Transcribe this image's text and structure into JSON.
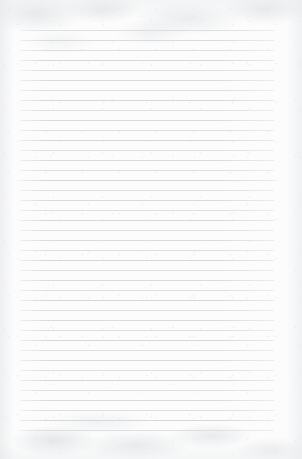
{
  "document": {
    "kind": "lined-notebook-paper",
    "title": "Blank Lined Paper",
    "content_text": "",
    "page_width": 302,
    "page_height": 459,
    "is_blank": "true"
  },
  "paper": {
    "background_color": "#fcfcfc",
    "texture_color": "#e3e5e9",
    "vignette_color": "#e2e4e8"
  },
  "ruling": {
    "line_color": "#d9dbde",
    "line_count": 41,
    "line_thickness": 1,
    "line_spacing": 10,
    "first_line_y": 30,
    "last_line_y": 430,
    "line_left_x": 20,
    "line_right_x": 274,
    "line_width": 254
  }
}
